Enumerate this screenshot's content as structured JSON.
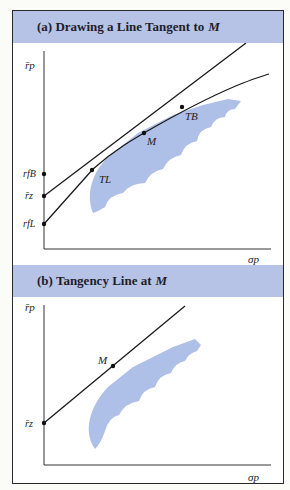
{
  "panel_a": {
    "title_prefix": "(a) Drawing a Line Tangent to",
    "title_var": "M",
    "y_axis_label": "r̄p",
    "x_axis_label": "σp",
    "points": {
      "M": "M",
      "T_B": "TB",
      "T_L": "TL",
      "r_fB": "rfB",
      "r_z": "r̄z",
      "r_fL": "rfL"
    }
  },
  "panel_b": {
    "title_prefix": "(b) Tangency Line at",
    "title_var": "M",
    "y_axis_label": "r̄p",
    "x_axis_label": "σp",
    "points": {
      "M": "M",
      "r_z": "r̄z"
    }
  },
  "colors": {
    "header_bg": "#b7c3e6",
    "region_fill": "#aebfe8",
    "line": "#1a1a1a"
  }
}
